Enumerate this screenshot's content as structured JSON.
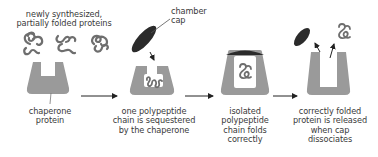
{
  "diagram": {
    "labels": {
      "new_proteins": [
        "newly synthesized,",
        "partially folded proteins"
      ],
      "chamber_cap": [
        "chamber",
        "cap"
      ],
      "chaperone_protein": [
        "chaperone",
        "protein"
      ],
      "step2": [
        "one polypeptide",
        "chain is sequestered",
        "by the chaperone"
      ],
      "step3": [
        "isolated",
        "polypeptide",
        "chain folds",
        "correctly"
      ],
      "step4": [
        "correctly folded",
        "protein is released",
        "when cap",
        "dissociates"
      ]
    },
    "colors": {
      "chaperone": "#9a9a9a",
      "cap": "#2b2b2b",
      "protein_stroke": "#6e6e6e",
      "arrow": "#222222",
      "text": "#3a3a3a"
    },
    "stages": [
      {
        "id": "empty-chaperone"
      },
      {
        "id": "sequestered"
      },
      {
        "id": "folding"
      },
      {
        "id": "released"
      }
    ]
  }
}
